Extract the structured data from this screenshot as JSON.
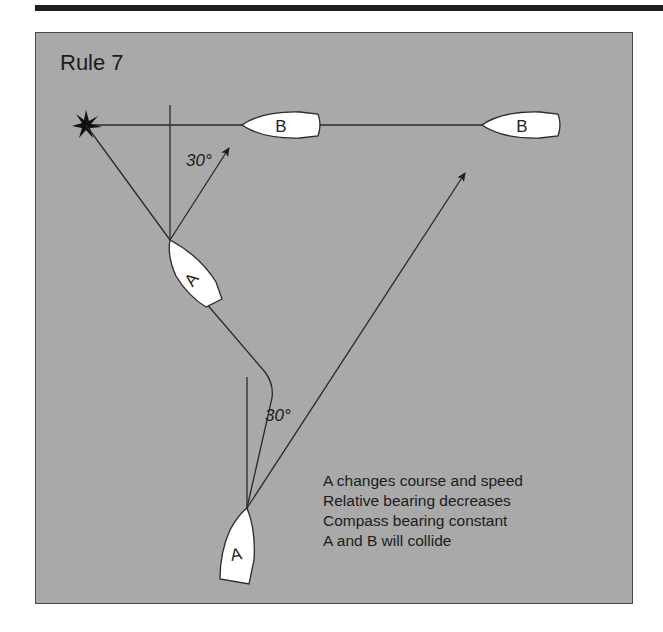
{
  "title": "Rule 7",
  "boats": {
    "b1": {
      "label": "B"
    },
    "b2": {
      "label": "B"
    },
    "a1": {
      "label": "A"
    },
    "a2": {
      "label": "A"
    }
  },
  "angles": {
    "upper": "30°",
    "lower": "30°"
  },
  "notes": [
    "A changes course and speed",
    "Relative bearing decreases",
    "Compass bearing constant",
    "A and B will collide"
  ],
  "colors": {
    "panel": "#a9a9a9",
    "line": "#2a2a2a",
    "boat_fill": "#ffffff",
    "top_bar": "#1e1e1e"
  }
}
